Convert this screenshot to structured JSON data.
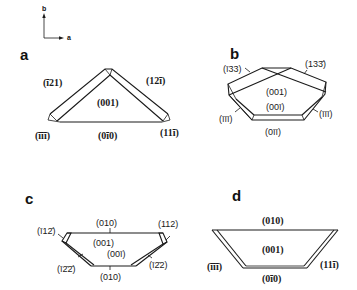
{
  "figure": {
    "type": "crystal habit drawings",
    "axes_indicator": {
      "vertical_label": "b",
      "horizontal_label": "a"
    },
    "panels": [
      {
        "letter": "a",
        "faces": {
          "top_left": "(ī21)",
          "top_right": "(12ī)",
          "center": "(001)",
          "bottom_left": "(īīī)",
          "bottom": "(0ī0)",
          "bottom_right": "(11ī)"
        }
      },
      {
        "letter": "b",
        "faces": {
          "top_left": "(ī33)",
          "top_right": "(133̄)",
          "center_top": "(001)",
          "center_bottom": "(00ī)",
          "left": "(īīī)",
          "right": "(īīī)",
          "bottom": "(0īī)"
        }
      },
      {
        "letter": "c",
        "faces": {
          "top": "(010)",
          "top_left": "(ī12̄)",
          "top_right": "(112)",
          "center_top": "(001)",
          "center_bottom": "(00ī)",
          "bottom_left": "(ī2̄2̄)",
          "bottom_right": "(ī2̄2)",
          "bottom": "(010)"
        }
      },
      {
        "letter": "d",
        "faces": {
          "top": "(010)",
          "center": "(001)",
          "left": "(īīī)",
          "right": "(11ī)",
          "bottom": "(0ī0)"
        }
      }
    ]
  }
}
